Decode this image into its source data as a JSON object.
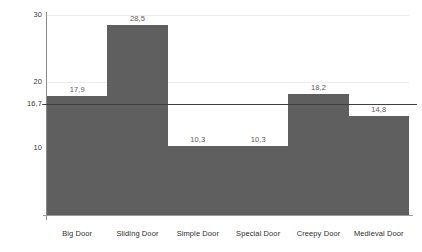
{
  "chart_data": {
    "type": "bar",
    "title": "",
    "subtitle": "",
    "xlabel": "",
    "ylabel": "",
    "categories": [
      "Big Door",
      "Sliding Door",
      "Simple Door",
      "Special Door",
      "Creepy Door",
      "Medieval Door"
    ],
    "values": [
      17.9,
      28.5,
      10.3,
      10.3,
      18.2,
      14.8
    ],
    "value_labels": [
      "17,9",
      "28,5",
      "10,3",
      "10,3",
      "18,2",
      "14,8"
    ],
    "ylim": [
      0,
      30
    ],
    "y_ticks": [
      10,
      20,
      30
    ],
    "y_tick_labels": [
      "10",
      "20",
      "30"
    ],
    "grid": true,
    "legend": "none",
    "bar_color": "#5f5f5f",
    "bar_gap": 0,
    "reference_line": {
      "value": 16.7,
      "label": "16,7",
      "color": "#3f3f3f"
    }
  }
}
